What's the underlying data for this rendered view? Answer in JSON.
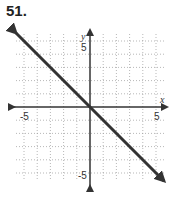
{
  "problem_number": "51.",
  "chart_data": {
    "type": "line",
    "title": "",
    "xlabel": "x",
    "ylabel": "y",
    "xlim": [
      -6,
      6
    ],
    "ylim": [
      -6,
      6
    ],
    "grid": true,
    "x_tick_labels": [
      "-5",
      "5"
    ],
    "y_tick_labels": [
      "5",
      "-5"
    ],
    "series": [
      {
        "name": "y = -x",
        "x": [
          -6,
          6
        ],
        "y": [
          6,
          -6
        ],
        "arrows": "both"
      }
    ]
  }
}
